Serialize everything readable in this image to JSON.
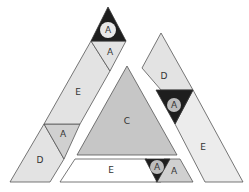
{
  "diagram": {
    "colors": {
      "light": "#e3e3e3",
      "mid": "#d0d0d0",
      "center": "#c6c6c6",
      "dark": "#1e1e1e",
      "circle": "#bdbdbd",
      "stroke": "#555555",
      "white": "#ffffff"
    },
    "left_strip": {
      "top_dark": {
        "label": "A"
      },
      "top_light": {
        "label": "A"
      },
      "middle": {
        "label": "E"
      },
      "small_triangle": {
        "label": "A"
      },
      "bottom": {
        "label": "D"
      }
    },
    "center_triangle": {
      "label": "C"
    },
    "bottom_strip": {
      "left": {
        "label": "E"
      },
      "dark_triangle": {
        "label": "A"
      },
      "light_triangle": {
        "label": "A"
      }
    },
    "right_strip": {
      "top": {
        "label": "D"
      },
      "dark_triangle": {
        "label": "A"
      },
      "bottom": {
        "label": "E"
      }
    }
  }
}
